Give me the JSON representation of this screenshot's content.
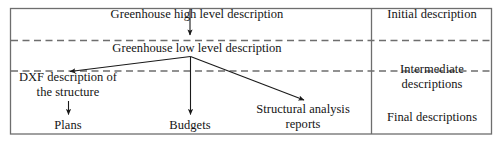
{
  "diagram": {
    "frame": {
      "stroke_color": "#6e6e6e",
      "dashed_color": "#6e6e6e",
      "arrow_color": "#1a1a1a",
      "background": "#ffffff"
    },
    "nodes": [
      {
        "id": "high_level",
        "label": "Greenhouse high level description",
        "band": "initial"
      },
      {
        "id": "low_level",
        "label": "Greenhouse low level description",
        "band": "initial"
      },
      {
        "id": "dxf",
        "label": "DXF description of the structure",
        "band": "intermediate"
      },
      {
        "id": "plans",
        "label": "Plans",
        "band": "final"
      },
      {
        "id": "budgets",
        "label": "Budgets",
        "band": "final"
      },
      {
        "id": "struct_rep",
        "label": "Structural analysis reports",
        "band": "final"
      }
    ],
    "node_text": {
      "high_level": "Greenhouse high level description",
      "low_level": "Greenhouse low level description",
      "dxf_line1": "DXF description of",
      "dxf_line2": "the structure",
      "plans": "Plans",
      "budgets": "Budgets",
      "struct_line1": "Structural analysis",
      "struct_line2": "reports"
    },
    "edges": [
      {
        "from": "high_level",
        "to": "low_level",
        "style": "solid-arrow"
      },
      {
        "from": "low_level",
        "to": "dxf",
        "style": "solid-arrow"
      },
      {
        "from": "low_level",
        "to": "budgets",
        "style": "solid-arrow"
      },
      {
        "from": "low_level",
        "to": "struct_rep",
        "style": "solid-arrow"
      },
      {
        "from": "dxf",
        "to": "plans",
        "style": "solid-arrow"
      }
    ],
    "bands": [
      {
        "id": "initial",
        "label": "Initial description"
      },
      {
        "id": "intermediate",
        "label_line1": "Intermediate",
        "label_line2": "descriptions"
      },
      {
        "id": "final",
        "label": "Final descriptions"
      }
    ],
    "legend_column": {
      "initial": "Initial description",
      "intermediate_line1": "Intermediate",
      "intermediate_line2": "descriptions",
      "final": "Final descriptions"
    }
  }
}
